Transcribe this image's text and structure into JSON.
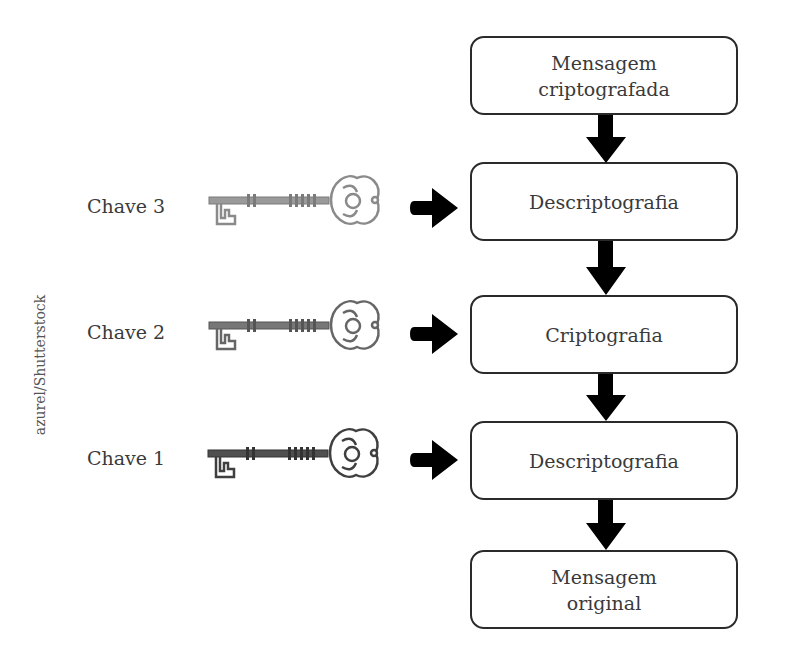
{
  "credit": "azurel/Shutterstock",
  "flow": {
    "boxes": [
      {
        "label": "Mensagem\ncriptografada"
      },
      {
        "label": "Descriptografia"
      },
      {
        "label": "Criptografia"
      },
      {
        "label": "Descriptografia"
      },
      {
        "label": "Mensagem\noriginal"
      }
    ]
  },
  "keys": [
    {
      "label": "Chave 3",
      "color": "#8a8a8a",
      "target": "Descriptografia"
    },
    {
      "label": "Chave 2",
      "color": "#666666",
      "target": "Criptografia"
    },
    {
      "label": "Chave 1",
      "color": "#3f3f3f",
      "target": "Descriptografia"
    }
  ],
  "colors": {
    "arrow": "#000000",
    "box_border": "#2a2a2a",
    "text": "#3a3a3a"
  }
}
